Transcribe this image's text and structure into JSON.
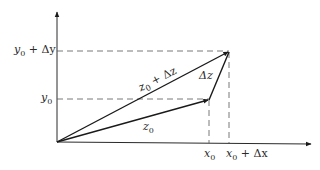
{
  "figure": {
    "type": "vector-diagram",
    "colors": {
      "stroke": "#1a1a1a",
      "axis": "#2a2a2a",
      "dashed": "#555555",
      "background": "#ffffff"
    }
  },
  "axes": {
    "x_axis": {
      "has_arrow": true
    },
    "y_axis": {
      "has_arrow": true
    }
  },
  "labels": {
    "y0": {
      "base": "y",
      "sub": "0",
      "suffix": ""
    },
    "y0_dy": {
      "base": "y",
      "sub": "0",
      "suffix": " + Δy"
    },
    "x0": {
      "base": "x",
      "sub": "0",
      "suffix": ""
    },
    "x0_dx": {
      "base": "x",
      "sub": "0",
      "suffix": " + Δx"
    },
    "z0": {
      "base": "z",
      "sub": "0",
      "suffix": ""
    },
    "z0_dz": {
      "base": "z",
      "sub": "0",
      "suffix": " + Δz"
    },
    "dz": {
      "text": "Δz"
    }
  },
  "vectors": [
    {
      "name": "z0",
      "from": [
        0,
        0
      ],
      "to": [
        "x0",
        "y0"
      ]
    },
    {
      "name": "z0 + Δz",
      "from": [
        0,
        0
      ],
      "to": [
        "x0 + Δx",
        "y0 + Δy"
      ]
    },
    {
      "name": "Δz",
      "from": [
        "x0",
        "y0"
      ],
      "to": [
        "x0 + Δx",
        "y0 + Δy"
      ]
    }
  ],
  "guides": [
    "dashed horizontal at y0",
    "dashed horizontal at y0 + Δy",
    "dashed vertical at x0",
    "dashed vertical at x0 + Δx"
  ]
}
